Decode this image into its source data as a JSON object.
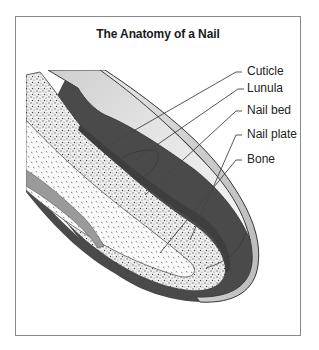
{
  "diagram": {
    "title": "The Anatomy of a Nail",
    "labels": [
      {
        "id": "cuticle",
        "text": "Cuticle"
      },
      {
        "id": "lunula",
        "text": "Lunula"
      },
      {
        "id": "nail-bed",
        "text": "Nail bed"
      },
      {
        "id": "nail-plate",
        "text": "Nail plate"
      },
      {
        "id": "bone",
        "text": "Bone"
      }
    ],
    "colors": {
      "frame": "#8a8a8a",
      "outline": "#3a3a3a",
      "nail_plate": "#d6d6d6",
      "skin_dark": "#555555",
      "tissue_stipple": "#e8e8e8",
      "bone_fill": "#f5f5f5",
      "leader_line": "#444444"
    }
  }
}
